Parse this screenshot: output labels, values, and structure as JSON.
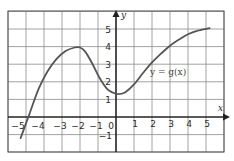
{
  "chart_data": {
    "type": "line",
    "title": "",
    "xlabel": "x",
    "ylabel": "y",
    "xlim": [
      -6,
      6
    ],
    "ylim": [
      -2,
      6
    ],
    "grid": true,
    "x_ticks": [
      -5,
      -4,
      -3,
      -2,
      -1,
      0,
      1,
      2,
      3,
      4,
      5
    ],
    "y_ticks": [
      -1,
      1,
      2,
      3,
      4,
      5
    ],
    "series": [
      {
        "name": "y = g(x)",
        "points": [
          [
            -5.3,
            -1.2
          ],
          [
            -4.8,
            0.2
          ],
          [
            -4.3,
            1.6
          ],
          [
            -3.8,
            2.6
          ],
          [
            -3.3,
            3.3
          ],
          [
            -2.8,
            3.75
          ],
          [
            -2.3,
            3.95
          ],
          [
            -2.0,
            3.95
          ],
          [
            -1.7,
            3.7
          ],
          [
            -1.3,
            3.0
          ],
          [
            -0.9,
            2.2
          ],
          [
            -0.5,
            1.6
          ],
          [
            -0.2,
            1.4
          ],
          [
            0.1,
            1.3
          ],
          [
            0.5,
            1.4
          ],
          [
            1.0,
            1.85
          ],
          [
            1.5,
            2.5
          ],
          [
            2.0,
            3.1
          ],
          [
            2.5,
            3.6
          ],
          [
            3.0,
            4.05
          ],
          [
            3.5,
            4.4
          ],
          [
            4.0,
            4.7
          ],
          [
            4.5,
            4.9
          ],
          [
            5.2,
            5.05
          ]
        ]
      }
    ],
    "annotations": [
      {
        "text": "y = g(x)",
        "x": 2.8,
        "y": 2.5
      }
    ],
    "labels": {
      "x_axis": "x",
      "y_axis": "y",
      "function": "y = g(x)",
      "xt": [
        "−5",
        "−4",
        "−3",
        "−2",
        "−1",
        "0",
        "1",
        "2",
        "3",
        "4",
        "5"
      ],
      "yt": [
        "5",
        "4",
        "3",
        "2",
        "1",
        "−1"
      ]
    }
  }
}
